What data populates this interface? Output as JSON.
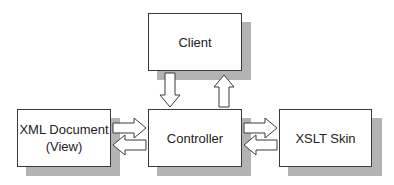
{
  "diagram": {
    "nodes": [
      {
        "id": "client",
        "label": "Client"
      },
      {
        "id": "controller",
        "label": "Controller"
      },
      {
        "id": "xml_document",
        "label_line1": "XML Document",
        "label_line2": "(View)"
      },
      {
        "id": "xslt_skin",
        "label": "XSLT Skin"
      }
    ],
    "edges": [
      {
        "from": "client",
        "to": "controller"
      },
      {
        "from": "controller",
        "to": "client"
      },
      {
        "from": "xml_document",
        "to": "controller"
      },
      {
        "from": "controller",
        "to": "xml_document"
      },
      {
        "from": "controller",
        "to": "xslt_skin"
      },
      {
        "from": "xslt_skin",
        "to": "controller"
      }
    ],
    "colors": {
      "border": "#3a3a3a",
      "shadow": "#b3b3b3",
      "fill": "#ffffff"
    }
  }
}
